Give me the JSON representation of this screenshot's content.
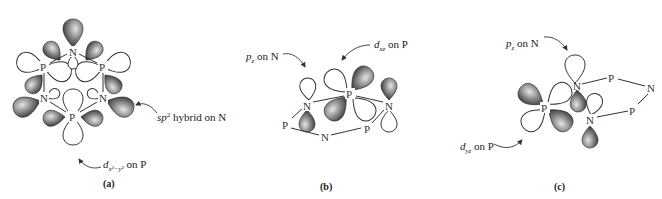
{
  "figure": {
    "panels": [
      {
        "id": "a",
        "caption": "(a)",
        "atoms": [
          "N",
          "P",
          "P",
          "N",
          "N",
          "P"
        ],
        "annotations": [
          {
            "text_main": "sp",
            "sup": "2",
            "text_rest": " hybrid on N"
          },
          {
            "text_main": "d",
            "sub": "x²−y²",
            "text_rest": " on P"
          }
        ]
      },
      {
        "id": "b",
        "caption": "(b)",
        "atoms": [
          "P",
          "N",
          "N",
          "P",
          "N",
          "P"
        ],
        "annotations": [
          {
            "text_main": "p",
            "sub": "z",
            "text_rest": " on N"
          },
          {
            "text_main": "d",
            "sub": "xz",
            "text_rest": " on P"
          }
        ]
      },
      {
        "id": "c",
        "caption": "(c)",
        "atoms": [
          "P",
          "N",
          "N",
          "P",
          "N",
          "P"
        ],
        "annotations": [
          {
            "text_main": "p",
            "sub": "z",
            "text_rest": " on N"
          },
          {
            "text_main": "d",
            "sub": "yz",
            "text_rest": " on P"
          }
        ]
      }
    ],
    "colors": {
      "lobe_shaded_dark": "#2a2a2a",
      "lobe_shaded_light": "#d8d8d8",
      "lobe_open": "#ffffff",
      "stroke": "#333333",
      "background": "#ffffff"
    }
  }
}
